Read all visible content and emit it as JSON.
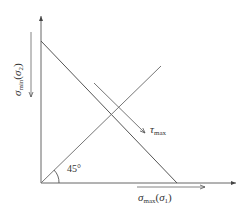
{
  "diagram": {
    "type": "stress-space diagram",
    "axes": {
      "x": {
        "symbol": "σ",
        "subscript": "max",
        "paren_symbol": "σ",
        "paren_subscript": "1",
        "label_text": "σmax(σ1)"
      },
      "y": {
        "symbol": "σ",
        "subscript": "min",
        "paren_symbol": "σ",
        "paren_subscript": "2",
        "label_text": "σmin(σ2)"
      }
    },
    "annotations": {
      "tau": {
        "symbol": "τ",
        "subscript": "max",
        "label_text": "τmax"
      },
      "angle": "45°"
    },
    "colors": {
      "line": "#555555",
      "background": "#ffffff"
    }
  }
}
